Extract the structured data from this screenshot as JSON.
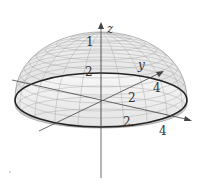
{
  "figure": {
    "axes": {
      "x": {
        "label": "",
        "ticks": [
          "2",
          "4"
        ]
      },
      "y": {
        "label": "y",
        "ticks": [
          "2",
          "4"
        ]
      },
      "z": {
        "label": "z",
        "ticks": [
          "1",
          "2"
        ]
      }
    },
    "labels": {
      "z_axis": "z",
      "y_axis": "y",
      "z_tick_1": "1",
      "z_tick_2": "2",
      "y_tick_4": "4",
      "y_tick_2": "2",
      "x_tick_2": "2",
      "x_tick_4": "4"
    },
    "colors": {
      "surface_fill": "#e8e8e8",
      "mesh": "#9a9a9a",
      "rim": "#222222",
      "axis": "#444444"
    }
  }
}
